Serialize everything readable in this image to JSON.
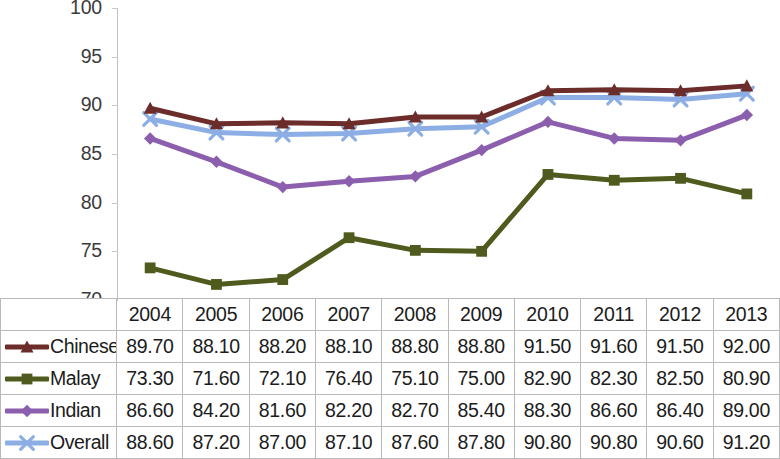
{
  "chart_data": {
    "type": "line",
    "title": "",
    "subtitle": "",
    "xlabel": "",
    "ylabel": "",
    "ylim": [
      70,
      100
    ],
    "ytick_labels": [
      "100",
      "95",
      "90",
      "85",
      "80",
      "75",
      "70"
    ],
    "yticks": [
      100,
      95,
      90,
      85,
      80,
      75,
      70
    ],
    "grid": false,
    "legend_position": "table-row-headers",
    "categories": [
      "2004",
      "2005",
      "2006",
      "2007",
      "2008",
      "2009",
      "2010",
      "2011",
      "2012",
      "2013"
    ],
    "x": [
      2004,
      2005,
      2006,
      2007,
      2008,
      2009,
      2010,
      2011,
      2012,
      2013
    ],
    "series": [
      {
        "name": "Chinese",
        "color": "#6B2C2A",
        "marker": "triangle",
        "values": [
          89.7,
          88.1,
          88.2,
          88.1,
          88.8,
          88.8,
          91.5,
          91.6,
          91.5,
          92.0
        ],
        "labels": [
          "89.70",
          "88.10",
          "88.20",
          "88.10",
          "88.80",
          "88.80",
          "91.50",
          "91.60",
          "91.50",
          "92.00"
        ]
      },
      {
        "name": "Malay",
        "color": "#4F5B1E",
        "marker": "square",
        "values": [
          73.3,
          71.6,
          72.1,
          76.4,
          75.1,
          75.0,
          82.9,
          82.3,
          82.5,
          80.9
        ],
        "labels": [
          "73.30",
          "71.60",
          "72.10",
          "76.40",
          "75.10",
          "75.00",
          "82.90",
          "82.30",
          "82.50",
          "80.90"
        ]
      },
      {
        "name": "Indian",
        "color": "#8C5FAE",
        "marker": "diamond",
        "values": [
          86.6,
          84.2,
          81.6,
          82.2,
          82.7,
          85.4,
          88.3,
          86.6,
          86.4,
          89.0
        ],
        "labels": [
          "86.60",
          "84.20",
          "81.60",
          "82.20",
          "82.70",
          "85.40",
          "88.30",
          "86.60",
          "86.40",
          "89.00"
        ]
      },
      {
        "name": "Overall",
        "color": "#8CAEE4",
        "marker": "x",
        "values": [
          88.6,
          87.2,
          87.0,
          87.1,
          87.6,
          87.8,
          90.8,
          90.8,
          90.6,
          91.2
        ],
        "labels": [
          "88.60",
          "87.20",
          "87.00",
          "87.10",
          "87.60",
          "87.80",
          "90.80",
          "90.80",
          "90.60",
          "91.20"
        ]
      }
    ]
  },
  "table": {
    "corner_label": "",
    "year_headers": [
      "2004",
      "2005",
      "2006",
      "2007",
      "2008",
      "2009",
      "2010",
      "2011",
      "2012",
      "2013"
    ],
    "rows": [
      {
        "label": "Chinese",
        "cells": [
          "89.70",
          "88.10",
          "88.20",
          "88.10",
          "88.80",
          "88.80",
          "91.50",
          "91.60",
          "91.50",
          "92.00"
        ]
      },
      {
        "label": "Malay",
        "cells": [
          "73.30",
          "71.60",
          "72.10",
          "76.40",
          "75.10",
          "75.00",
          "82.90",
          "82.30",
          "82.50",
          "80.90"
        ]
      },
      {
        "label": "Indian",
        "cells": [
          "86.60",
          "84.20",
          "81.60",
          "82.20",
          "82.70",
          "85.40",
          "88.30",
          "86.60",
          "86.40",
          "89.00"
        ]
      },
      {
        "label": "Overall",
        "cells": [
          "88.60",
          "87.20",
          "87.00",
          "87.10",
          "87.60",
          "87.80",
          "90.80",
          "90.80",
          "90.60",
          "91.20"
        ]
      }
    ]
  },
  "axis": {
    "y_labels": [
      "100",
      "95",
      "90",
      "85",
      "80",
      "75",
      "70"
    ]
  }
}
